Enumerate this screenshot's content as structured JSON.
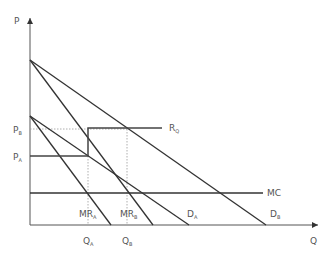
{
  "diagram": {
    "axes": {
      "y_label": "P",
      "x_label": "Q"
    },
    "price_labels": {
      "pb": {
        "main": "P",
        "sub": "B"
      },
      "pa": {
        "main": "P",
        "sub": "A"
      }
    },
    "quantity_labels": {
      "qa": {
        "main": "Q",
        "sub": "A"
      },
      "qb": {
        "main": "Q",
        "sub": "B"
      }
    },
    "curves": {
      "da": {
        "main": "D",
        "sub": "A"
      },
      "db": {
        "main": "D",
        "sub": "B"
      },
      "mra": {
        "main": "MR",
        "sub": "A"
      },
      "mrb": {
        "main": "MR",
        "sub": "B"
      },
      "mc": {
        "main": "MC"
      },
      "rq": {
        "main": "R",
        "sub": "Q"
      }
    },
    "colors": {
      "line": "#333333",
      "dotted": "#999999",
      "label": "#555555"
    }
  }
}
